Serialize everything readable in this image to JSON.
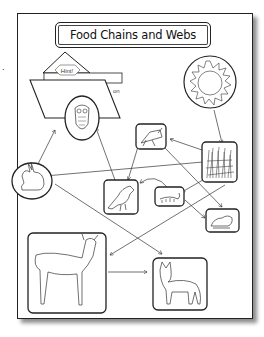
{
  "title": "Food Chains and Webs",
  "hint_folder": {
    "tab_label": "Hint!",
    "partial_text": "on"
  },
  "edge_mark": ".",
  "nodes": [
    {
      "id": "sun",
      "label": "sun",
      "icon": "sun-icon"
    },
    {
      "id": "grass",
      "label": "grass",
      "icon": "grass-icon"
    },
    {
      "id": "grasshopper",
      "label": "grasshopper",
      "icon": "grasshopper-icon"
    },
    {
      "id": "owl",
      "label": "owl",
      "icon": "owl-icon"
    },
    {
      "id": "rabbit",
      "label": "rabbit",
      "icon": "rabbit-icon"
    },
    {
      "id": "bird",
      "label": "bird",
      "icon": "bird-icon"
    },
    {
      "id": "caterpillar",
      "label": "caterpillar",
      "icon": "caterpillar-icon"
    },
    {
      "id": "frog",
      "label": "frog",
      "icon": "frog-icon"
    },
    {
      "id": "deer",
      "label": "deer",
      "icon": "deer-icon"
    },
    {
      "id": "wolf",
      "label": "wolf",
      "icon": "wolf-icon"
    }
  ],
  "edges": [
    {
      "from": "sun",
      "to": "grass"
    },
    {
      "from": "grass",
      "to": "grasshopper"
    },
    {
      "from": "grass",
      "to": "rabbit"
    },
    {
      "from": "grass",
      "to": "caterpillar"
    },
    {
      "from": "grass",
      "to": "deer"
    },
    {
      "from": "grasshopper",
      "to": "bird"
    },
    {
      "from": "grasshopper",
      "to": "frog"
    },
    {
      "from": "caterpillar",
      "to": "bird"
    },
    {
      "from": "caterpillar",
      "to": "frog"
    },
    {
      "from": "bird",
      "to": "owl"
    },
    {
      "from": "rabbit",
      "to": "owl"
    },
    {
      "from": "rabbit",
      "to": "wolf"
    },
    {
      "from": "deer",
      "to": "wolf"
    }
  ]
}
